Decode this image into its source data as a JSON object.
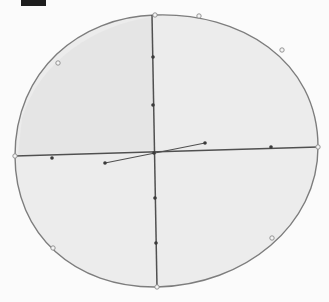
{
  "canvas": {
    "width": 329,
    "height": 302,
    "background": "#fbfbfb"
  },
  "colors": {
    "ellipse_fill": "#ececec",
    "ellipse_stroke": "#7d7d7d",
    "shade_fill": "#e2e2e2",
    "axis_stroke": "#505050",
    "marker_fill": "#3a3a3a",
    "handle_fill": "#f4f4f4",
    "handle_stroke": "#8a8a8a",
    "black_bar": "#1e1e1e"
  },
  "diagram": {
    "ellipse_path": "M 15 156 C 15 70 80 17 155 15 C 240 12 318 60 318 147 C 318 225 245 285 157 287 C 75 288 15 235 15 156 Z",
    "shade_path": "M 22 118 C 40 60 95 25 152 17 L 154 150 L 18 155 Z",
    "vertical_axis": {
      "x1": 152,
      "y1": 15,
      "x2": 157,
      "y2": 287
    },
    "horizontal_axis": {
      "x1": 15,
      "y1": 156,
      "x2": 318,
      "y2": 147
    },
    "slanted_segment": {
      "x1": 105,
      "y1": 163,
      "x2": 205,
      "y2": 143
    },
    "outline_handles": [
      {
        "cx": 58,
        "cy": 63
      },
      {
        "cx": 155,
        "cy": 15
      },
      {
        "cx": 199,
        "cy": 16
      },
      {
        "cx": 282,
        "cy": 50
      },
      {
        "cx": 15,
        "cy": 156
      },
      {
        "cx": 318,
        "cy": 147
      },
      {
        "cx": 53,
        "cy": 248
      },
      {
        "cx": 157,
        "cy": 287
      },
      {
        "cx": 272,
        "cy": 238
      }
    ],
    "axis_markers": [
      {
        "cx": 153,
        "cy": 57
      },
      {
        "cx": 153,
        "cy": 105
      },
      {
        "cx": 154,
        "cy": 153
      },
      {
        "cx": 155,
        "cy": 198
      },
      {
        "cx": 156,
        "cy": 243
      },
      {
        "cx": 52,
        "cy": 158
      },
      {
        "cx": 105,
        "cy": 163
      },
      {
        "cx": 205,
        "cy": 143
      },
      {
        "cx": 271,
        "cy": 147
      }
    ]
  }
}
